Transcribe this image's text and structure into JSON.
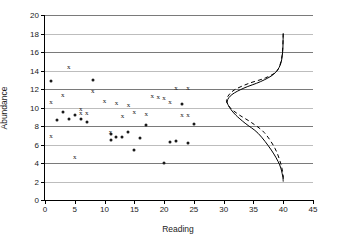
{
  "chart_data": {
    "type": "scatter",
    "title": "",
    "xlabel": "Reading",
    "ylabel": "Abundance",
    "xlim": [
      0,
      45
    ],
    "ylim": [
      0,
      20
    ],
    "xticks": [
      0,
      5,
      10,
      15,
      20,
      25,
      30,
      35,
      40,
      45
    ],
    "yticks": [
      0,
      2,
      4,
      6,
      8,
      10,
      12,
      14,
      16,
      18,
      20
    ],
    "grid": "horizontal",
    "legend": "none",
    "series": [
      {
        "name": "cross-markers",
        "marker": "x",
        "color": "#1a1a1a",
        "points": [
          [
            1,
            10.6
          ],
          [
            1,
            6.9
          ],
          [
            3,
            11.35
          ],
          [
            4,
            14.4
          ],
          [
            5,
            4.65
          ],
          [
            6,
            9.8
          ],
          [
            6,
            9.45
          ],
          [
            7,
            9.4
          ],
          [
            8,
            11.75
          ],
          [
            10,
            10.65
          ],
          [
            11,
            7.3
          ],
          [
            12,
            10.5
          ],
          [
            13,
            9.05
          ],
          [
            14,
            10.3
          ],
          [
            15,
            9.55
          ],
          [
            17,
            9.35
          ],
          [
            18,
            11.2
          ],
          [
            19,
            11.15
          ],
          [
            20,
            11.05
          ],
          [
            21,
            10.6
          ],
          [
            22,
            12.15
          ],
          [
            23,
            9.15
          ],
          [
            24,
            12.15
          ],
          [
            24,
            9.15
          ]
        ]
      },
      {
        "name": "dot-markers",
        "marker": "circle",
        "color": "#1a1a1a",
        "points": [
          [
            1,
            12.9
          ],
          [
            2,
            8.7
          ],
          [
            3,
            9.5
          ],
          [
            4,
            8.75
          ],
          [
            5,
            9.2
          ],
          [
            6,
            8.75
          ],
          [
            7,
            8.45
          ],
          [
            8,
            12.95
          ],
          [
            11,
            6.5
          ],
          [
            11,
            7.15
          ],
          [
            12,
            6.85
          ],
          [
            13,
            6.8
          ],
          [
            14,
            7.4
          ],
          [
            15,
            5.45
          ],
          [
            16,
            6.7
          ],
          [
            17,
            8.1
          ],
          [
            20,
            4.05
          ],
          [
            21,
            6.3
          ],
          [
            22,
            6.4
          ],
          [
            23,
            10.35
          ],
          [
            24,
            6.15
          ],
          [
            25,
            8.25
          ]
        ]
      }
    ],
    "curves": [
      {
        "name": "solid-distribution-curve",
        "style": "solid",
        "color": "#000000",
        "points": [
          [
            40,
            18.0
          ],
          [
            39.9,
            16.0
          ],
          [
            39.5,
            14.6
          ],
          [
            38.4,
            13.6
          ],
          [
            36.2,
            12.8
          ],
          [
            33.4,
            12.1
          ],
          [
            31.4,
            11.4
          ],
          [
            30.6,
            10.7
          ],
          [
            31.0,
            10.0
          ],
          [
            32.0,
            9.2
          ],
          [
            33.6,
            8.3
          ],
          [
            35.8,
            7.2
          ],
          [
            38.0,
            5.4
          ],
          [
            39.4,
            3.8
          ],
          [
            39.9,
            2.6
          ],
          [
            40,
            2.0
          ]
        ]
      },
      {
        "name": "dashed-distribution-curve",
        "style": "dashed",
        "color": "#000000",
        "points": [
          [
            40,
            18.0
          ],
          [
            39.8,
            15.6
          ],
          [
            39.0,
            14.0
          ],
          [
            37.0,
            13.2
          ],
          [
            34.2,
            12.6
          ],
          [
            31.8,
            11.9
          ],
          [
            30.7,
            11.2
          ],
          [
            30.5,
            10.6
          ],
          [
            31.2,
            9.9
          ],
          [
            32.6,
            9.2
          ],
          [
            34.6,
            8.4
          ],
          [
            36.8,
            7.3
          ],
          [
            38.6,
            5.6
          ],
          [
            39.6,
            3.9
          ],
          [
            40,
            2.6
          ],
          [
            40,
            2.0
          ]
        ]
      }
    ]
  },
  "axes": {
    "y_title": "Abundance",
    "x_title": "Reading"
  }
}
